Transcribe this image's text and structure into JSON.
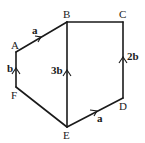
{
  "diagram": {
    "title": "",
    "vertices": [
      {
        "id": "A",
        "label": "A",
        "x": 16,
        "y": 52
      },
      {
        "id": "B",
        "label": "B",
        "x": 67,
        "y": 22
      },
      {
        "id": "C",
        "label": "C",
        "x": 123,
        "y": 22
      },
      {
        "id": "D",
        "label": "D",
        "x": 123,
        "y": 98
      },
      {
        "id": "E",
        "label": "E",
        "x": 67,
        "y": 127
      },
      {
        "id": "F",
        "label": "F",
        "x": 16,
        "y": 87
      }
    ],
    "edges": [
      {
        "from": "A",
        "to": "B",
        "vector": "a",
        "arrow": "A→B"
      },
      {
        "from": "B",
        "to": "C",
        "vector": "",
        "arrow": ""
      },
      {
        "from": "D",
        "to": "C",
        "vector": "2b",
        "arrow": "D→C"
      },
      {
        "from": "E",
        "to": "D",
        "vector": "a",
        "arrow": "E→D"
      },
      {
        "from": "F",
        "to": "E",
        "vector": "",
        "arrow": ""
      },
      {
        "from": "F",
        "to": "A",
        "vector": "b",
        "arrow": "F→A"
      },
      {
        "from": "E",
        "to": "B",
        "vector": "3b",
        "arrow": "E→B"
      }
    ],
    "labels": {
      "A": "A",
      "B": "B",
      "C": "C",
      "D": "D",
      "E": "E",
      "F": "F",
      "ab": "a",
      "dc": "2b",
      "ed": "a",
      "fa": "b",
      "eb": "3b"
    },
    "stroke_color": "#1a1a1a"
  }
}
